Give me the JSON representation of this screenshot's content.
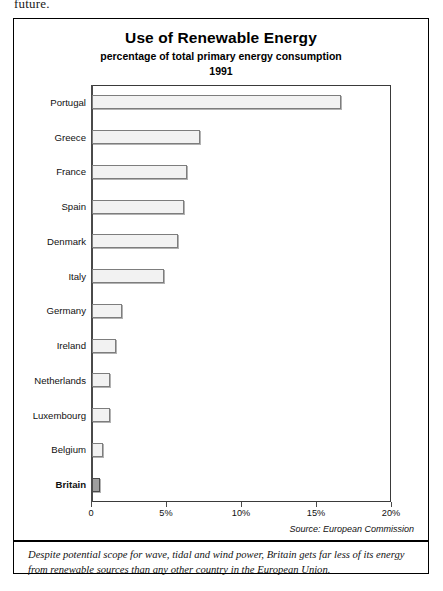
{
  "page": {
    "cut_off_text": "future."
  },
  "chart_data": {
    "type": "bar",
    "orientation": "horizontal",
    "title": "Use of Renewable Energy",
    "subtitle": "percentage of total primary energy consumption",
    "year": "1991",
    "xlabel": "",
    "ylabel": "",
    "xlim": [
      0,
      20
    ],
    "grid": false,
    "legend": null,
    "tick_labels": [
      "0",
      "5%",
      "10%",
      "15%",
      "20%"
    ],
    "tick_values": [
      0,
      5,
      10,
      15,
      20
    ],
    "categories": [
      "Portugal",
      "Greece",
      "France",
      "Spain",
      "Denmark",
      "Italy",
      "Germany",
      "Ireland",
      "Netherlands",
      "Luxembourg",
      "Belgium",
      "Britain"
    ],
    "values": [
      16.6,
      7.2,
      6.3,
      6.1,
      5.7,
      4.8,
      2.0,
      1.6,
      1.2,
      1.2,
      0.7,
      0.5
    ],
    "highlight_category": "Britain",
    "source": "Source: European Commission"
  },
  "caption": {
    "text": "Despite potential scope for wave, tidal and wind power, Britain gets far less of its energy from renewable sources than any other country in the European Union."
  },
  "colors": {
    "bar_fill": "#f2f2f2",
    "bar_border": "#7d7d7d",
    "highlight_fill": "#9e9e9e",
    "highlight_border": "#4a4a4a",
    "axis": "#4a4a4a",
    "frame": "#000000"
  }
}
